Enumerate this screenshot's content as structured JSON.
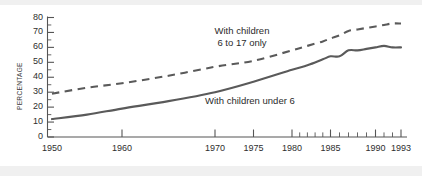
{
  "chart_data": {
    "type": "line",
    "title": "",
    "xlabel": "",
    "ylabel": "PERCENTAGE",
    "xlim": [
      1950,
      1993
    ],
    "ylim": [
      0,
      80
    ],
    "grid": false,
    "legend_position": "inline-annotations",
    "y_ticks": [
      0,
      10,
      20,
      30,
      40,
      50,
      60,
      70,
      80
    ],
    "y_tick_labels": [
      "0",
      "10",
      "20",
      "30",
      "40",
      "50",
      "60",
      "70",
      "80"
    ],
    "y_minor_step": 5,
    "x_ticks": [
      1950,
      1960,
      1970,
      1975,
      1980,
      1985,
      1990,
      1993
    ],
    "x_tick_labels": [
      "1950",
      "1960",
      "1970",
      "1975",
      "1980",
      "1985",
      "1990",
      "1993"
    ],
    "x_minor_ticks": [
      1981,
      1982,
      1983,
      1984,
      1986,
      1987,
      1988,
      1989,
      1991,
      1992
    ],
    "series": [
      {
        "name": "With children 6 to 17 only",
        "style": "dashed",
        "color": "#5a5a5a",
        "x": [
          1950,
          1955,
          1960,
          1965,
          1970,
          1975,
          1980,
          1982,
          1984,
          1985,
          1986,
          1987,
          1988,
          1989,
          1990,
          1991,
          1992,
          1993
        ],
        "values": [
          29,
          33,
          36,
          41,
          47,
          51,
          58,
          61,
          64,
          66,
          68,
          71,
          72,
          73,
          74,
          75,
          76,
          76
        ]
      },
      {
        "name": "With children under 6",
        "style": "solid",
        "color": "#5a5a5a",
        "x": [
          1950,
          1955,
          1960,
          1965,
          1970,
          1975,
          1980,
          1982,
          1984,
          1985,
          1986,
          1987,
          1988,
          1989,
          1990,
          1991,
          1992,
          1993
        ],
        "values": [
          12,
          15,
          19,
          24,
          30,
          37,
          45,
          48,
          52,
          54,
          54,
          58,
          58,
          59,
          60,
          61,
          60,
          60
        ]
      }
    ],
    "annotations": [
      {
        "text_line1": "With children",
        "text_line2": "6 to 17 only"
      },
      {
        "text_line1": "With children under 6",
        "text_line2": ""
      }
    ]
  }
}
